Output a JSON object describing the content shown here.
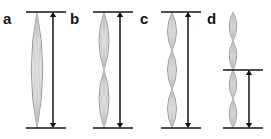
{
  "figure": {
    "title": "",
    "background_color": "#ffffff",
    "width": 271,
    "height": 139,
    "stroke_colors": {
      "lens_outline": "#8c8c8c",
      "lens_inner": "#bdbdbd",
      "lens_fill": "#f7f7f7",
      "arrow": "#141414",
      "tick": "#141414"
    },
    "baseline_top_y": 12,
    "baseline_bottom_y": 128
  },
  "panels": [
    {
      "label": "a",
      "label_x": 3,
      "label_y": 11,
      "axis_x": 37,
      "arrow_x": 53,
      "lens_count": 1,
      "lens_width": 23,
      "segment_top": 12,
      "segment_bottom": 128,
      "arrow_top": 12,
      "arrow_bottom": 128,
      "tick_x_start": 26,
      "tick_x_end": 66,
      "inner_lines": 7,
      "measure_label": ""
    },
    {
      "label": "b",
      "label_x": 70,
      "label_y": 11,
      "axis_x": 104,
      "arrow_x": 120,
      "lens_count": 2,
      "lens_width": 20,
      "segment_top": 12,
      "segment_bottom": 128,
      "arrow_top": 12,
      "arrow_bottom": 128,
      "tick_x_start": 93,
      "tick_x_end": 133,
      "inner_lines": 7,
      "measure_label": ""
    },
    {
      "label": "c",
      "label_x": 140,
      "label_y": 11,
      "axis_x": 172,
      "arrow_x": 188,
      "lens_count": 3,
      "lens_width": 18,
      "segment_top": 12,
      "segment_bottom": 128,
      "arrow_top": 12,
      "arrow_bottom": 128,
      "tick_x_start": 161,
      "tick_x_end": 201,
      "inner_lines": 7,
      "measure_label": ""
    },
    {
      "label": "d",
      "label_x": 207,
      "label_y": 11,
      "axis_x": 233,
      "arrow_x": 249,
      "lens_count": 4,
      "lens_width": 15,
      "segment_top": 12,
      "segment_bottom": 128,
      "arrow_top": 70,
      "arrow_bottom": 128,
      "tick_x_start": 223,
      "tick_x_end": 263,
      "inner_lines": 7,
      "measure_label": ""
    }
  ],
  "chart_data": {
    "type": "diagram",
    "categories": [
      "a",
      "b",
      "c",
      "d"
    ],
    "segment_counts": [
      1,
      2,
      3,
      4
    ],
    "total_height_px": [
      116,
      116,
      116,
      116
    ],
    "segment_height_px": [
      116,
      58,
      38.7,
      29
    ],
    "measured_span_px": [
      116,
      116,
      116,
      58
    ],
    "measured_span_segments": [
      1,
      2,
      3,
      2
    ],
    "xlabel": "",
    "ylabel": "",
    "legend": []
  }
}
